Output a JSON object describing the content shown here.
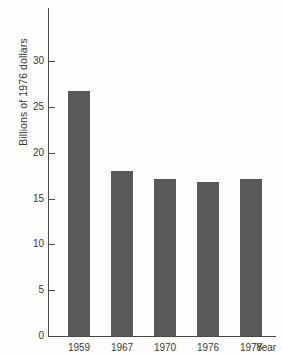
{
  "chart_data": {
    "type": "bar",
    "title": "",
    "subtitle": "",
    "categories": [
      "1959",
      "1967",
      "1970",
      "1976",
      "1978"
    ],
    "values": [
      26.8,
      18.0,
      17.1,
      16.8,
      17.1
    ],
    "xlabel": "Year",
    "ylabel": "Billions of 1976 dollars",
    "ylim": [
      0,
      33
    ],
    "yticks": [
      0,
      5,
      10,
      15,
      20,
      25,
      30
    ],
    "ytick_labels": [
      "0",
      "5",
      "10",
      "15",
      "20",
      "25",
      "30"
    ],
    "grid": false,
    "legend": null,
    "bar_color": "#595959",
    "axis_color": "#4a4a4a",
    "background_color": "#fdfdfb"
  }
}
